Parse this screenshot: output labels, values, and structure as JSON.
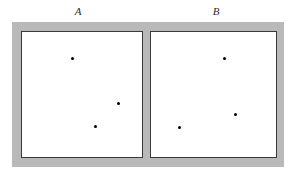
{
  "figure": {
    "type": "diagram",
    "background_color": "#ffffff",
    "wall_color": "#b9b9b9",
    "chamber_fill": "#ffffff",
    "chamber_border_color": "#3a3a3a",
    "particle_color": "#000000"
  },
  "labels": {
    "chamber_a": "A",
    "chamber_b": "B"
  },
  "chambers": [
    {
      "id": "chamber-a",
      "label": "A",
      "particle_count": 3,
      "particles": [
        {
          "x": 72,
          "y": 58
        },
        {
          "x": 118,
          "y": 103
        },
        {
          "x": 95,
          "y": 126
        }
      ]
    },
    {
      "id": "chamber-b",
      "label": "B",
      "particle_count": 3,
      "particles": [
        {
          "x": 224,
          "y": 58
        },
        {
          "x": 235,
          "y": 114
        },
        {
          "x": 179,
          "y": 127
        }
      ]
    }
  ],
  "partition": {
    "present": true,
    "orientation": "vertical",
    "x": 143,
    "width": 7
  }
}
